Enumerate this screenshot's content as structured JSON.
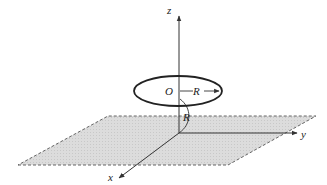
{
  "figure": {
    "axes": {
      "z_label": "z",
      "y_label": "y",
      "x_label": "x"
    },
    "ring": {
      "center_label": "O",
      "radius_label": "R"
    },
    "height": {
      "label": "R"
    },
    "plane": {
      "fill_color": "#d9d9d9",
      "edge_style": "dashed"
    },
    "colors": {
      "line": "#333333",
      "plane_fill": "#d9d9d9"
    }
  }
}
